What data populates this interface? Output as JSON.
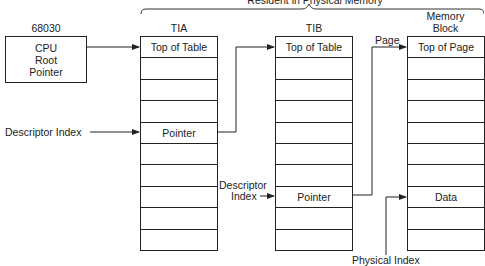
{
  "header": {
    "resident_label": "Resident in Physical Memory"
  },
  "cpu": {
    "caption": "68030",
    "lines": [
      "CPU",
      "Root",
      "Pointer"
    ]
  },
  "tables": {
    "tia": {
      "title": "TIA",
      "rows": [
        "Top of Table",
        "",
        "",
        "",
        "Pointer",
        "",
        "",
        "",
        "",
        ""
      ]
    },
    "tib": {
      "title": "TIB",
      "rows": [
        "Top of Table",
        "",
        "",
        "",
        "",
        "",
        "",
        "Pointer",
        "",
        ""
      ]
    },
    "memory_block": {
      "title_line1": "Memory",
      "title_line2": "Block",
      "rows": [
        "Top of Page",
        "",
        "",
        "",
        "",
        "",
        "",
        "Data",
        "",
        ""
      ]
    }
  },
  "labels": {
    "descriptor_index_a": "Descriptor Index",
    "descriptor_index_b_line1": "Descriptor",
    "descriptor_index_b_line2": "Index",
    "page": "Page",
    "physical_index": "Physical Index"
  }
}
